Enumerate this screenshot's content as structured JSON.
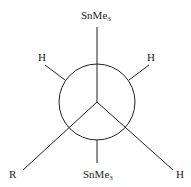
{
  "diagram": {
    "type": "newman-projection",
    "front_substituents": {
      "top": {
        "text": "SnMe",
        "sub": "3"
      },
      "bottom_left": {
        "text": "R"
      },
      "bottom_right": {
        "text": "H"
      }
    },
    "rear_substituents": {
      "upper_left": {
        "text": "H"
      },
      "upper_right": {
        "text": "H"
      },
      "bottom": {
        "text": "SnMe",
        "sub": "3"
      }
    },
    "colors": {
      "line": "#222222",
      "background": "#ffffff"
    }
  }
}
